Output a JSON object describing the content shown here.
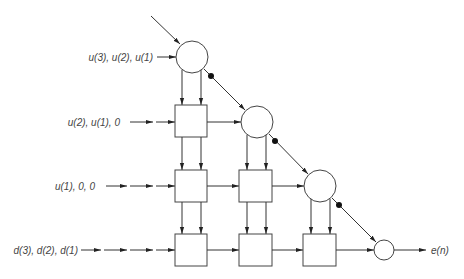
{
  "diagram": {
    "type": "systolic-array-qr-rls",
    "input_labels": [
      {
        "text": "u(3), u(2), u(1)",
        "row": 1
      },
      {
        "text": "u(2), u(1),   0",
        "row": 2
      },
      {
        "text": "u(1),   0,    0",
        "row": 3
      },
      {
        "text": "d(3), d(2), d(1)",
        "row": 4
      }
    ],
    "output_label": "e(n)",
    "boundary_cells": [
      {
        "id": "boundary-1",
        "row": 1,
        "col": 1
      },
      {
        "id": "boundary-2",
        "row": 2,
        "col": 2
      },
      {
        "id": "boundary-3",
        "row": 3,
        "col": 3
      }
    ],
    "internal_cells": [
      {
        "id": "internal-2-1",
        "row": 2,
        "col": 1
      },
      {
        "id": "internal-3-1",
        "row": 3,
        "col": 1
      },
      {
        "id": "internal-3-2",
        "row": 3,
        "col": 2
      },
      {
        "id": "internal-4-1",
        "row": 4,
        "col": 1
      },
      {
        "id": "internal-4-2",
        "row": 4,
        "col": 2
      },
      {
        "id": "internal-4-3",
        "row": 4,
        "col": 3
      }
    ],
    "final_cell": {
      "id": "final-multiplier",
      "row": 4,
      "col": 4
    },
    "delay_elements": 3,
    "colors": {
      "stroke": "#333333",
      "background": "#ffffff"
    }
  }
}
